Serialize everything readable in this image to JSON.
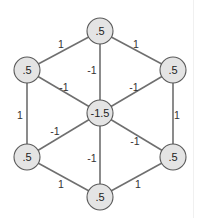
{
  "diagram": {
    "type": "weighted-graph",
    "nodes": [
      {
        "id": "top",
        "label": ".5",
        "x": 100,
        "y": 31
      },
      {
        "id": "upper-left",
        "label": ".5",
        "x": 27,
        "y": 70
      },
      {
        "id": "upper-right",
        "label": ".5",
        "x": 173,
        "y": 70
      },
      {
        "id": "center",
        "label": "-1.5",
        "x": 100,
        "y": 113
      },
      {
        "id": "lower-left",
        "label": ".5",
        "x": 27,
        "y": 157
      },
      {
        "id": "lower-right",
        "label": ".5",
        "x": 173,
        "y": 157
      },
      {
        "id": "bottom",
        "label": ".5",
        "x": 100,
        "y": 197
      }
    ],
    "edges": [
      {
        "from": "top",
        "to": "upper-left",
        "weight": "1",
        "lx": 61,
        "ly": 44
      },
      {
        "from": "top",
        "to": "upper-right",
        "weight": "1",
        "lx": 136,
        "ly": 44
      },
      {
        "from": "upper-left",
        "to": "lower-left",
        "weight": "1",
        "lx": 20,
        "ly": 115
      },
      {
        "from": "upper-right",
        "to": "lower-right",
        "weight": "1",
        "lx": 177,
        "ly": 115
      },
      {
        "from": "lower-left",
        "to": "bottom",
        "weight": "1",
        "lx": 61,
        "ly": 184
      },
      {
        "from": "lower-right",
        "to": "bottom",
        "weight": "1",
        "lx": 138,
        "ly": 184
      },
      {
        "from": "top",
        "to": "center",
        "weight": "-1",
        "lx": 92,
        "ly": 70
      },
      {
        "from": "upper-left",
        "to": "center",
        "weight": "-1",
        "lx": 64,
        "ly": 87
      },
      {
        "from": "upper-right",
        "to": "center",
        "weight": "-1",
        "lx": 134,
        "ly": 87
      },
      {
        "from": "lower-left",
        "to": "center",
        "weight": "-1",
        "lx": 55,
        "ly": 131
      },
      {
        "from": "lower-right",
        "to": "center",
        "weight": "-1",
        "lx": 135,
        "ly": 141
      },
      {
        "from": "bottom",
        "to": "center",
        "weight": "-1",
        "lx": 92,
        "ly": 158
      }
    ],
    "node_radius": 13,
    "colors": {
      "node_fill": "#e4e4e4",
      "node_stroke": "#5a5a5a",
      "edge": "#6f6f6f",
      "text": "#222222"
    }
  }
}
